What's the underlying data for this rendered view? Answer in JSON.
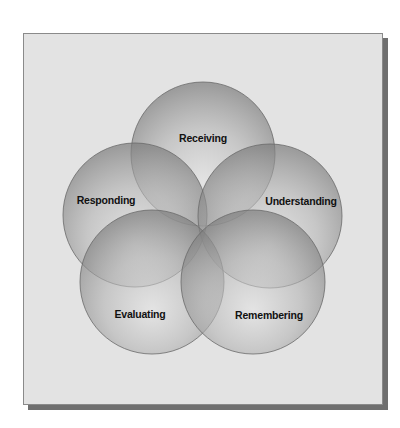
{
  "diagram": {
    "type": "overlapping-circles",
    "colors": {
      "panel_background": "#e3e3e3",
      "circle_fill_light": "#d6d6d6",
      "circle_fill_dark": "#8c8c8c",
      "circle_stroke": "#6a6a6a",
      "label_color": "#111111"
    },
    "stages": [
      {
        "id": "receiving",
        "label": "Receiving"
      },
      {
        "id": "understanding",
        "label": "Understanding"
      },
      {
        "id": "remembering",
        "label": "Remembering"
      },
      {
        "id": "evaluating",
        "label": "Evaluating"
      },
      {
        "id": "responding",
        "label": "Responding"
      }
    ]
  }
}
